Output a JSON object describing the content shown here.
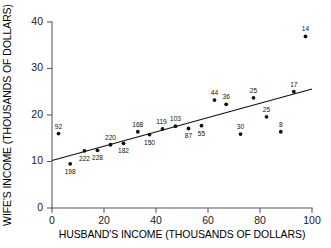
{
  "chart_data": {
    "type": "scatter",
    "title": "",
    "xlabel": "HUSBAND'S INCOME (THOUSANDS OF DOLLARS)",
    "ylabel": "WIFE'S INCOME (THOUSANDS OF DOLLARS)",
    "xlim": [
      0,
      100
    ],
    "ylim": [
      0,
      40
    ],
    "xticks": [
      0,
      20,
      40,
      60,
      80,
      100
    ],
    "yticks": [
      0,
      10,
      20,
      30,
      40
    ],
    "xtick_labels": [
      "0",
      "20",
      "40",
      "60",
      "80",
      "100"
    ],
    "ytick_labels": [
      "0",
      "10",
      "20",
      "30",
      "40"
    ],
    "grid": false,
    "legend": false,
    "point_color": "#111111",
    "line_color": "#111111",
    "axis_color": "#5d5d5d",
    "background": "#ffffff",
    "points": [
      {
        "label": "92",
        "x": 2.5,
        "y": 16.0,
        "label_dx": 0,
        "label_dy": -5
      },
      {
        "label": "198",
        "x": 7.0,
        "y": 9.5,
        "label_dx": 0,
        "label_dy": 10
      },
      {
        "label": "222",
        "x": 12.5,
        "y": 12.3,
        "label_dx": 0,
        "label_dy": 10
      },
      {
        "label": "228",
        "x": 17.5,
        "y": 12.4,
        "label_dx": 0,
        "label_dy": 10
      },
      {
        "label": "220",
        "x": 22.5,
        "y": 13.6,
        "label_dx": 0,
        "label_dy": -5
      },
      {
        "label": "182",
        "x": 27.5,
        "y": 13.9,
        "label_dx": 0,
        "label_dy": 10
      },
      {
        "label": "168",
        "x": 33.0,
        "y": 16.4,
        "label_dx": 0,
        "label_dy": -5
      },
      {
        "label": "150",
        "x": 37.5,
        "y": 15.8,
        "label_dx": 0,
        "label_dy": 10
      },
      {
        "label": "119",
        "x": 42.5,
        "y": 17.0,
        "label_dx": -1,
        "label_dy": -5
      },
      {
        "label": "103",
        "x": 47.5,
        "y": 17.6,
        "label_dx": 0,
        "label_dy": -5
      },
      {
        "label": "87",
        "x": 52.5,
        "y": 17.1,
        "label_dx": 0,
        "label_dy": 10
      },
      {
        "label": "55",
        "x": 57.5,
        "y": 17.7,
        "label_dx": 0,
        "label_dy": 10
      },
      {
        "label": "44",
        "x": 62.5,
        "y": 23.2,
        "label_dx": 0,
        "label_dy": -5
      },
      {
        "label": "36",
        "x": 67.0,
        "y": 22.3,
        "label_dx": 0,
        "label_dy": -5
      },
      {
        "label": "30",
        "x": 72.5,
        "y": 15.9,
        "label_dx": 0,
        "label_dy": -5
      },
      {
        "label": "25",
        "x": 77.5,
        "y": 23.7,
        "label_dx": 0,
        "label_dy": -5
      },
      {
        "label": "25",
        "x": 82.5,
        "y": 19.6,
        "label_dx": 0,
        "label_dy": -5
      },
      {
        "label": "8",
        "x": 88.0,
        "y": 16.4,
        "label_dx": 0,
        "label_dy": -5
      },
      {
        "label": "17",
        "x": 93.0,
        "y": 25.0,
        "label_dx": 0,
        "label_dy": -5
      },
      {
        "label": "14",
        "x": 97.5,
        "y": 36.9,
        "label_dx": 0,
        "label_dy": -5
      }
    ],
    "fit_line": {
      "x_start": 0,
      "y_start": 10.2,
      "x_end": 100,
      "y_end": 25.6
    }
  }
}
